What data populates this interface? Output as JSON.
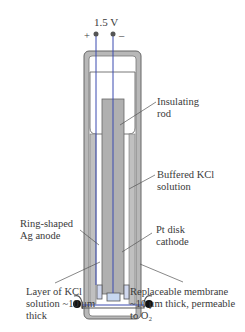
{
  "diagram": {
    "voltage": "1.5 V",
    "plus": "+",
    "minus": "–",
    "labels": {
      "insulating_rod": "Insulating\nrod",
      "buffered_kcl": "Buffered KCl\nsolution",
      "ring_anode": "Ring-shaped\nAg anode",
      "pt_cathode": "Pt disk\ncathode",
      "kcl_layer": "Layer of KCl\nsolution ~10 μm\nthick",
      "membrane": "Replaceable membrane\n~10 μm thick, permeable\nto O₂"
    },
    "colors": {
      "wire": "#3b4bb0",
      "body_gray": "#b8b8b8",
      "outline": "#555555",
      "cathode_fill": "#c8d8f0"
    }
  }
}
